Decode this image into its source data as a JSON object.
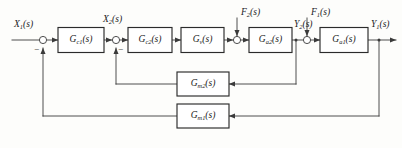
{
  "diagram": {
    "type": "control-system-block-diagram",
    "background_color": "#fdfdfb",
    "line_color": "#3a3a3a",
    "block_fill": "#ffffff",
    "block_stroke": "#2b2b2b",
    "text_color": "#1b1b1b"
  },
  "signals": {
    "input": "X",
    "input_sub": "1",
    "input_arg": "(s)",
    "inner_input": "X",
    "inner_input_sub": "2",
    "inner_input_arg": "(s)",
    "disturbance_2": "F",
    "disturbance_2_sub": "2",
    "disturbance_2_arg": "(s)",
    "disturbance_1": "F",
    "disturbance_1_sub": "1",
    "disturbance_1_arg": "(s)",
    "inner_output": "Y",
    "inner_output_sub": "2",
    "inner_output_arg": "(s)",
    "output": "Y",
    "output_sub": "1",
    "output_arg": "(s)"
  },
  "blocks": [
    {
      "id": "gc1",
      "name": "G",
      "sub": "c1",
      "arg": "(s)",
      "role": "outer-controller"
    },
    {
      "id": "gc2",
      "name": "G",
      "sub": "c2",
      "arg": "(s)",
      "role": "inner-controller"
    },
    {
      "id": "gv",
      "name": "G",
      "sub": "v",
      "arg": "(s)",
      "role": "valve"
    },
    {
      "id": "ga2",
      "name": "G",
      "sub": "a2",
      "arg": "(s)",
      "role": "inner-process"
    },
    {
      "id": "ga1",
      "name": "G",
      "sub": "a1",
      "arg": "(s)",
      "role": "outer-process"
    },
    {
      "id": "gm2",
      "name": "G",
      "sub": "m2",
      "arg": "(s)",
      "role": "inner-measurement"
    },
    {
      "id": "gm1",
      "name": "G",
      "sub": "m1",
      "arg": "(s)",
      "role": "outer-measurement"
    }
  ],
  "summing_junctions": [
    {
      "id": "sum1",
      "feedback_sign": "−",
      "label": "outer-loop-summing-junction"
    },
    {
      "id": "sum2",
      "feedback_sign": "−",
      "label": "inner-loop-summing-junction"
    },
    {
      "id": "sum3",
      "label": "inner-disturbance-junction"
    },
    {
      "id": "sum4",
      "label": "outer-disturbance-junction"
    }
  ]
}
